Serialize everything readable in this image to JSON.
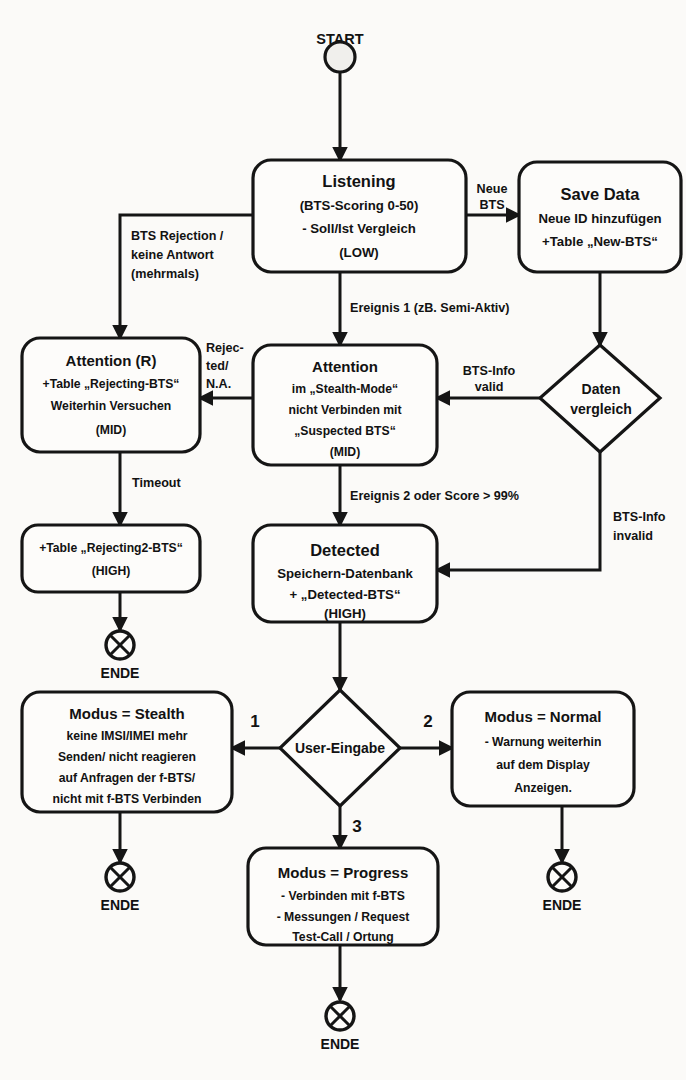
{
  "diagram": {
    "language": "de",
    "ink_color": "#151515",
    "paper_color": "#fbfaf8"
  },
  "nodes": {
    "start": {
      "label": "START",
      "shape": "circle"
    },
    "listening": {
      "shape": "rounded-rect",
      "title": "Listening",
      "lines": [
        "(BTS-Scoring 0-50)",
        "- Soll/Ist Vergleich",
        "(LOW)"
      ]
    },
    "save_data": {
      "shape": "rounded-rect",
      "title": "Save Data",
      "lines": [
        "Neue ID hinzufügen",
        "+Table „New-BTS“"
      ]
    },
    "attention_r": {
      "shape": "rounded-rect",
      "title": "Attention (R)",
      "lines": [
        "+Table „Rejecting-BTS“",
        "Weiterhin Versuchen",
        "(MID)"
      ]
    },
    "attention": {
      "shape": "rounded-rect",
      "title": "Attention",
      "lines": [
        "im „Stealth-Mode“",
        "nicht Verbinden mit",
        "„Suspected BTS“",
        "(MID)"
      ]
    },
    "daten_vergleich": {
      "shape": "diamond",
      "lines": [
        "Daten",
        "vergleich"
      ]
    },
    "rejecting2": {
      "shape": "rounded-rect",
      "lines": [
        "+Table „Rejecting2-BTS“",
        "(HIGH)"
      ]
    },
    "detected": {
      "shape": "rounded-rect",
      "title": "Detected",
      "lines": [
        "Speichern-Datenbank",
        "+ „Detected-BTS“",
        "(HIGH)"
      ]
    },
    "user_eingabe": {
      "shape": "diamond",
      "lines": [
        "User-Eingabe"
      ]
    },
    "modus_stealth": {
      "shape": "rounded-rect",
      "title": "Modus = Stealth",
      "lines": [
        "keine IMSI/IMEI mehr",
        "Senden/ nicht reagieren",
        "auf Anfragen der f-BTS/",
        "nicht mit f-BTS Verbinden"
      ]
    },
    "modus_normal": {
      "shape": "rounded-rect",
      "title": "Modus = Normal",
      "lines": [
        "- Warnung weiterhin",
        "auf dem Display",
        "Anzeigen."
      ]
    },
    "modus_progress": {
      "shape": "rounded-rect",
      "title": "Modus = Progress",
      "lines": [
        "- Verbinden mit f-BTS",
        "- Messungen / Request",
        "Test-Call / Ortung"
      ]
    },
    "end_rejecting2": {
      "label": "ENDE",
      "shape": "end-circle"
    },
    "end_stealth": {
      "label": "ENDE",
      "shape": "end-circle"
    },
    "end_normal": {
      "label": "ENDE",
      "shape": "end-circle"
    },
    "end_progress": {
      "label": "ENDE",
      "shape": "end-circle"
    }
  },
  "edges": [
    {
      "id": "start-listening",
      "from": "start",
      "to": "listening",
      "label": ""
    },
    {
      "id": "listening-save",
      "from": "listening",
      "to": "save_data",
      "label_lines": [
        "Neue",
        "BTS"
      ]
    },
    {
      "id": "save-daten",
      "from": "save_data",
      "to": "daten_vergleich",
      "label": ""
    },
    {
      "id": "daten-attention",
      "from": "daten_vergleich",
      "to": "attention",
      "label_lines": [
        "BTS-Info",
        "valid"
      ]
    },
    {
      "id": "daten-detected",
      "from": "daten_vergleich",
      "to": "detected",
      "label_lines": [
        "BTS-Info",
        "invalid"
      ]
    },
    {
      "id": "listening-attention",
      "from": "listening",
      "to": "attention",
      "label": "Ereignis 1 (zB. Semi-Aktiv)"
    },
    {
      "id": "listening-attentionr",
      "from": "listening",
      "to": "attention_r",
      "label_lines": [
        "BTS Rejection /",
        "keine Antwort",
        "(mehrmals)"
      ]
    },
    {
      "id": "attention-attentionr",
      "from": "attention",
      "to": "attention_r",
      "label_lines": [
        "Rejec-",
        "ted/",
        "N.A."
      ]
    },
    {
      "id": "attentionr-rejecting2",
      "from": "attention_r",
      "to": "rejecting2",
      "label": "Timeout"
    },
    {
      "id": "rejecting2-end",
      "from": "rejecting2",
      "to": "end_rejecting2",
      "label": ""
    },
    {
      "id": "attention-detected",
      "from": "attention",
      "to": "detected",
      "label": "Ereignis 2 oder Score > 99%"
    },
    {
      "id": "detected-user",
      "from": "detected",
      "to": "user_eingabe",
      "label": ""
    },
    {
      "id": "user-stealth",
      "from": "user_eingabe",
      "to": "modus_stealth",
      "label": "1"
    },
    {
      "id": "user-normal",
      "from": "user_eingabe",
      "to": "modus_normal",
      "label": "2"
    },
    {
      "id": "user-progress",
      "from": "user_eingabe",
      "to": "modus_progress",
      "label": "3"
    },
    {
      "id": "stealth-end",
      "from": "modus_stealth",
      "to": "end_stealth",
      "label": ""
    },
    {
      "id": "normal-end",
      "from": "modus_normal",
      "to": "end_normal",
      "label": ""
    },
    {
      "id": "progress-end",
      "from": "modus_progress",
      "to": "end_progress",
      "label": ""
    }
  ],
  "text": {
    "start_label": "START",
    "end_label": "ENDE",
    "listening_title": "Listening",
    "listening_l1": "(BTS-Scoring 0-50)",
    "listening_l2": "- Soll/Ist Vergleich",
    "listening_l3": "(LOW)",
    "save_title": "Save Data",
    "save_l1": "Neue ID hinzufügen",
    "save_l2": "+Table „New-BTS“",
    "neue": "Neue",
    "bts": "BTS",
    "attention_r_title": "Attention (R)",
    "attention_r_l1": "+Table „Rejecting-BTS“",
    "attention_r_l2": "Weiterhin Versuchen",
    "attention_r_l3": "(MID)",
    "attention_title": "Attention",
    "attention_l1": "im „Stealth-Mode“",
    "attention_l2": "nicht Verbinden mit",
    "attention_l3": "„Suspected BTS“",
    "attention_l4": "(MID)",
    "daten_l1": "Daten",
    "daten_l2": "vergleich",
    "btsinfo_valid_1": "BTS-Info",
    "btsinfo_valid_2": "valid",
    "btsinfo_invalid_1": "BTS-Info",
    "btsinfo_invalid_2": "invalid",
    "ereignis1": "Ereignis 1 (zB. Semi-Aktiv)",
    "ereignis2": "Ereignis 2 oder Score > 99%",
    "btsrej_1": "BTS Rejection /",
    "btsrej_2": "keine Antwort",
    "btsrej_3": "(mehrmals)",
    "rejected_1": "Rejec-",
    "rejected_2": "ted/",
    "rejected_3": "N.A.",
    "timeout": "Timeout",
    "rejecting2_l1": "+Table „Rejecting2-BTS“",
    "rejecting2_l2": "(HIGH)",
    "detected_title": "Detected",
    "detected_l1": "Speichern-Datenbank",
    "detected_l2": "+ „Detected-BTS“",
    "detected_l3": "(HIGH)",
    "user_eingabe": "User-Eingabe",
    "num1": "1",
    "num2": "2",
    "num3": "3",
    "stealth_title": "Modus = Stealth",
    "stealth_l1": "keine IMSI/IMEI mehr",
    "stealth_l2": "Senden/ nicht reagieren",
    "stealth_l3": "auf Anfragen der f-BTS/",
    "stealth_l4": "nicht mit f-BTS Verbinden",
    "normal_title": "Modus = Normal",
    "normal_l1": "- Warnung weiterhin",
    "normal_l2": "auf dem Display",
    "normal_l3": "Anzeigen.",
    "progress_title": "Modus = Progress",
    "progress_l1": "- Verbinden mit f-BTS",
    "progress_l2": "- Messungen / Request",
    "progress_l3": "Test-Call / Ortung"
  }
}
